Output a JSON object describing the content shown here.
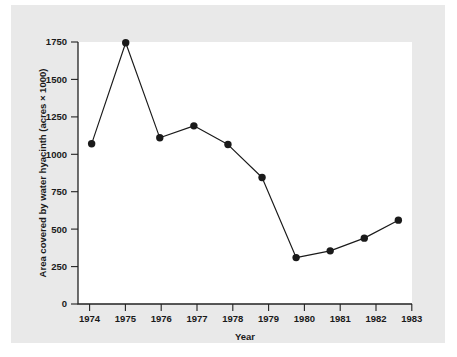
{
  "figure": {
    "background_color": "#e9e9e9",
    "plot_background_color": "#ffffff",
    "axis_color": "#222222",
    "series_color": "#1a1a1a"
  },
  "chart_data": {
    "type": "line",
    "title": "",
    "subtitle": "",
    "xlabel": "Year",
    "ylabel": "Area covered by water hyacinth (acres × 1000)",
    "categories": [
      "1974",
      "1975",
      "1976",
      "1977",
      "1978",
      "1979",
      "1980",
      "1981",
      "1982",
      "1983"
    ],
    "x": [
      1974,
      1975,
      1976,
      1977,
      1978,
      1979,
      1980,
      1981,
      1982,
      1983
    ],
    "values": [
      1070,
      1745,
      1110,
      1190,
      1065,
      845,
      310,
      355,
      440,
      560
    ],
    "series": [
      {
        "name": "Area covered by water hyacinth",
        "values": [
          1070,
          1745,
          1110,
          1190,
          1065,
          845,
          310,
          355,
          440,
          560
        ]
      }
    ],
    "xlim": [
      1973.6,
      1983.4
    ],
    "ylim": [
      0,
      1800
    ],
    "yticks": [
      0,
      250,
      500,
      750,
      1000,
      1250,
      1500,
      1750
    ],
    "ytick_labels": [
      "0",
      "250",
      "500",
      "750",
      "1000",
      "1250",
      "1500",
      "1750"
    ],
    "xticks": [
      1974,
      1975,
      1976,
      1977,
      1978,
      1979,
      1980,
      1981,
      1982,
      1983
    ],
    "xtick_labels": [
      "1974",
      "1975",
      "1976",
      "1977",
      "1978",
      "1979",
      "1980",
      "1981",
      "1982",
      "1983"
    ],
    "grid": false,
    "legend": null,
    "legend_position": "none",
    "marker": "circle",
    "line_color": "#1a1a1a",
    "marker_color": "#1a1a1a",
    "annotations": []
  },
  "axes": {
    "y_title": "Area covered by water hyacinth (acres × 1000)",
    "x_title": "Year"
  }
}
